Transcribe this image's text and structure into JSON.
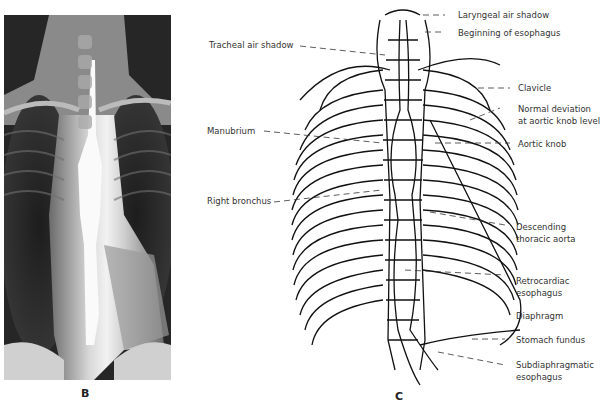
{
  "panels": {
    "b": {
      "label": "B",
      "content": "Chest radiograph with barium-filled esophagus"
    },
    "c": {
      "label": "C",
      "content": "Line drawing of thoracic skeleton and esophagus"
    }
  },
  "annotations": {
    "left": [
      {
        "id": "tracheal",
        "text": "Tracheal air shadow"
      },
      {
        "id": "manubrium",
        "text": "Manubrium"
      },
      {
        "id": "right_bronchus",
        "text": "Right bronchus"
      }
    ],
    "right": [
      {
        "id": "laryngeal",
        "text": "Laryngeal air shadow"
      },
      {
        "id": "beginning",
        "text": "Beginning of esophagus"
      },
      {
        "id": "clavicle",
        "text": "Clavicle"
      },
      {
        "id": "normal_dev_1",
        "text": "Normal deviation"
      },
      {
        "id": "normal_dev_2",
        "text": "at aortic knob level"
      },
      {
        "id": "aortic_knob",
        "text": "Aortic knob"
      },
      {
        "id": "desc_aorta_1",
        "text": "Descending"
      },
      {
        "id": "desc_aorta_2",
        "text": "thoracic aorta"
      },
      {
        "id": "retro_1",
        "text": "Retrocardiac"
      },
      {
        "id": "retro_2",
        "text": "esophagus"
      },
      {
        "id": "diaphragm",
        "text": "Diaphragm"
      },
      {
        "id": "stomach",
        "text": "Stomach fundus"
      },
      {
        "id": "subdia_1",
        "text": "Subdiaphragmatic"
      },
      {
        "id": "subdia_2",
        "text": "esophagus"
      }
    ]
  }
}
